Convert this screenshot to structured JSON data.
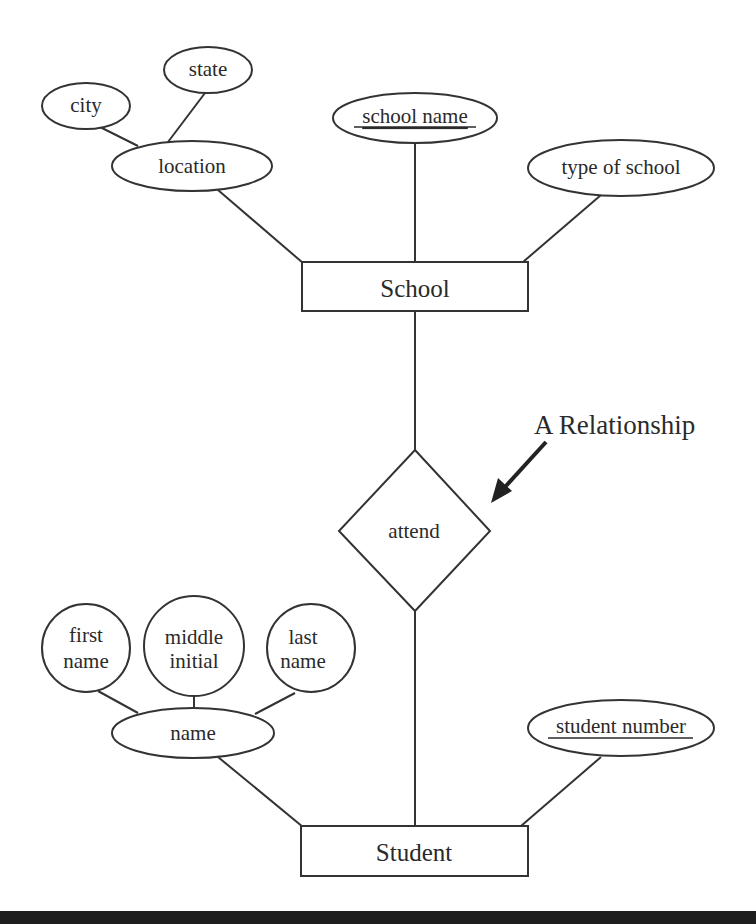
{
  "diagram": {
    "type": "entity-relationship",
    "entities": [
      {
        "id": "school",
        "label": "School"
      },
      {
        "id": "student",
        "label": "Student"
      }
    ],
    "relationships": [
      {
        "id": "attend",
        "label": "attend",
        "connects": [
          "School",
          "Student"
        ]
      }
    ],
    "attributes": {
      "city": {
        "label": "city",
        "parent": "location"
      },
      "state": {
        "label": "state",
        "parent": "location"
      },
      "location": {
        "label": "location",
        "parent": "School"
      },
      "school_name": {
        "label": "school name",
        "parent": "School",
        "key": true
      },
      "type_of_school": {
        "label": "type of school",
        "parent": "School"
      },
      "first_name": {
        "line1": "first",
        "line2": "name",
        "parent": "name"
      },
      "middle_initial": {
        "line1": "middle",
        "line2": "initial",
        "parent": "name"
      },
      "last_name": {
        "line1": "last",
        "line2": "name",
        "parent": "name"
      },
      "name": {
        "label": "name",
        "parent": "Student"
      },
      "student_number": {
        "label": "student number",
        "parent": "Student",
        "key": true
      }
    },
    "annotation": {
      "label": "A Relationship",
      "points_to": "attend"
    }
  },
  "colors": {
    "stroke": "#333333",
    "text": "#2a2a2a",
    "background": "#ffffff",
    "bottom_rule": "#1e1e1e"
  }
}
